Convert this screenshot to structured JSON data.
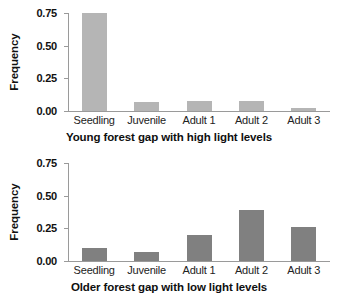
{
  "chart_data": [
    {
      "type": "bar",
      "title": "",
      "xlabel": "Young forest gap with high light levels",
      "ylabel": "Frequency",
      "categories": [
        "Seedling",
        "Juvenile",
        "Adult 1",
        "Adult 2",
        "Adult 3"
      ],
      "values": [
        0.75,
        0.07,
        0.08,
        0.08,
        0.02
      ],
      "ylim": [
        0.0,
        0.75
      ],
      "yticks": [
        0.0,
        0.25,
        0.5,
        0.75
      ],
      "ytick_labels": [
        "0.00",
        "0.25",
        "0.50",
        "0.75"
      ],
      "grid": false,
      "legend": "none",
      "bar_color": "#b5b5b5"
    },
    {
      "type": "bar",
      "title": "",
      "xlabel": "Older forest gap with low light levels",
      "ylabel": "Frequency",
      "categories": [
        "Seedling",
        "Juvenile",
        "Adult 1",
        "Adult 2",
        "Adult 3"
      ],
      "values": [
        0.1,
        0.07,
        0.2,
        0.39,
        0.26
      ],
      "ylim": [
        0.0,
        0.75
      ],
      "yticks": [
        0.0,
        0.25,
        0.5,
        0.75
      ],
      "ytick_labels": [
        "0.00",
        "0.25",
        "0.50",
        "0.75"
      ],
      "grid": false,
      "legend": "none",
      "bar_color": "#808080"
    }
  ],
  "panels": [
    {
      "ylabel": "Frequency",
      "xtitle": "Young forest gap with high light levels",
      "ytick_labels": [
        "0.75",
        "0.50",
        "0.25",
        "0.00"
      ],
      "categories": [
        "Seedling",
        "Juvenile",
        "Adult 1",
        "Adult 2",
        "Adult 3"
      ]
    },
    {
      "ylabel": "Frequency",
      "xtitle": "Older forest gap with low light levels",
      "ytick_labels": [
        "0.75",
        "0.50",
        "0.25",
        "0.00"
      ],
      "categories": [
        "Seedling",
        "Juvenile",
        "Adult 1",
        "Adult 2",
        "Adult 3"
      ]
    }
  ],
  "colors": {
    "axis": "#9a9a9a",
    "text": "#111111",
    "bar_light": "#b5b5b5",
    "bar_dark": "#808080",
    "background": "#ffffff"
  }
}
